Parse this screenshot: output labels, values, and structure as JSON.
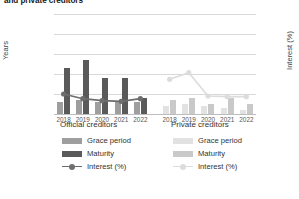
{
  "title": "and private creditors",
  "axes": {
    "left_label": "Years",
    "right_label": "Interest (%)",
    "left_ticks": [
      "0",
      "10",
      "20",
      "30",
      "40",
      "50"
    ],
    "right_ticks": [
      "0",
      "3",
      "6",
      "9",
      "12",
      "15"
    ]
  },
  "panels": [
    {
      "key": "official",
      "title": "Official creditors"
    },
    {
      "key": "private",
      "title": "Private creditors"
    }
  ],
  "legend": {
    "grace_label": "Grace period",
    "maturity_label": "Maturity",
    "interest_label": "Interest (%)"
  },
  "colors": {
    "official_grace": "#9e9e9e",
    "official_maturity": "#5a5a5a",
    "official_line": "#6e6e6e",
    "private_grace": "#e2e2e2",
    "private_maturity": "#c9c9c9",
    "private_line": "#dcdcdc",
    "grid": "#d9d9d9",
    "text": "#333333"
  },
  "chart_data": {
    "type": "bar",
    "title": "and private creditors",
    "xlabel": "",
    "ylabel": "Years",
    "y2label": "Interest (%)",
    "ylim": [
      0,
      50
    ],
    "y2lim": [
      0,
      15
    ],
    "grid": true,
    "legend_position": "bottom",
    "categories": [
      "2018",
      "2019",
      "2020",
      "2021",
      "2022"
    ],
    "panels": [
      {
        "name": "Official creditors",
        "series": [
          {
            "name": "Grace period",
            "type": "bar",
            "axis": "left",
            "values": [
              6,
              7,
              6,
              6,
              6
            ]
          },
          {
            "name": "Maturity",
            "type": "bar",
            "axis": "left",
            "values": [
              23,
              27,
              18,
              18,
              8
            ]
          },
          {
            "name": "Interest (%)",
            "type": "line",
            "axis": "right",
            "values": [
              3.0,
              2.3,
              2.0,
              1.9,
              2.3
            ]
          }
        ]
      },
      {
        "name": "Private creditors",
        "series": [
          {
            "name": "Grace period",
            "type": "bar",
            "axis": "left",
            "values": [
              4,
              5,
              4,
              3,
              2
            ]
          },
          {
            "name": "Maturity",
            "type": "bar",
            "axis": "left",
            "values": [
              7,
              8,
              5,
              8,
              5
            ]
          },
          {
            "name": "Interest (%)",
            "type": "line",
            "axis": "right",
            "values": [
              5.2,
              6.2,
              2.7,
              2.6,
              2.6
            ]
          }
        ]
      }
    ]
  }
}
